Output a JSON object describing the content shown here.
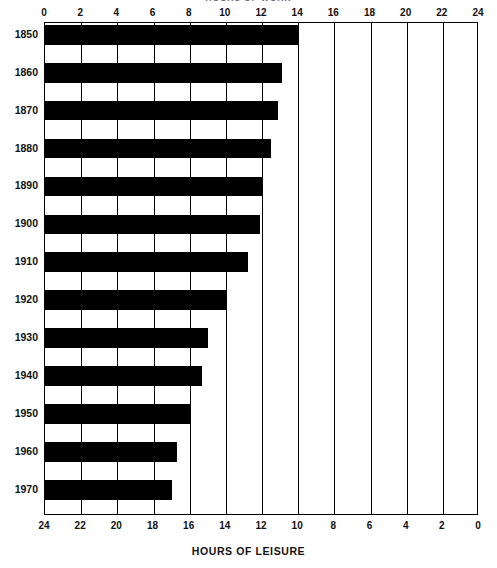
{
  "chart_data": {
    "type": "bar",
    "orientation": "horizontal",
    "title": "HOURS OF WORK",
    "bottom_caption": "HOURS OF LEISURE",
    "categories": [
      "1850",
      "1860",
      "1870",
      "1880",
      "1890",
      "1900",
      "1910",
      "1920",
      "1930",
      "1940",
      "1950",
      "1960",
      "1970"
    ],
    "values": [
      14.0,
      13.1,
      12.9,
      12.5,
      12.0,
      11.9,
      11.2,
      10.0,
      9.0,
      8.7,
      8.0,
      7.3,
      7.0
    ],
    "series": [
      {
        "name": "HOURS OF WORK",
        "values": [
          14.0,
          13.1,
          12.9,
          12.5,
          12.0,
          11.9,
          11.2,
          10.0,
          9.0,
          8.7,
          8.0,
          7.3,
          7.0
        ]
      },
      {
        "name": "HOURS OF LEISURE",
        "values": [
          10.0,
          10.9,
          11.1,
          11.5,
          12.0,
          12.1,
          12.8,
          14.0,
          15.0,
          15.3,
          16.0,
          16.7,
          17.0
        ]
      }
    ],
    "xlabel": "HOURS OF WORK",
    "ylabel": "",
    "xlim": [
      0,
      24
    ],
    "top_axis_ticks": [
      "0",
      "2",
      "4",
      "6",
      "8",
      "10",
      "12",
      "14",
      "16",
      "18",
      "20",
      "22",
      "24"
    ],
    "bottom_axis_ticks": [
      "24",
      "22",
      "20",
      "18",
      "16",
      "14",
      "12",
      "10",
      "8",
      "6",
      "4",
      "2",
      "0"
    ],
    "top_axis_direction": "left-to-right ascending",
    "bottom_axis_direction": "left-to-right descending",
    "grid": true,
    "gridline_interval": 2,
    "legend": "none",
    "bar_color": "#000000",
    "background_color": "#ffffff"
  },
  "axes": {
    "top": {
      "label": "HOURS OF WORK",
      "ticks": [
        "0",
        "2",
        "4",
        "6",
        "8",
        "10",
        "12",
        "14",
        "16",
        "18",
        "20",
        "22",
        "24"
      ]
    },
    "bottom": {
      "label": "HOURS OF LEISURE",
      "ticks": [
        "24",
        "22",
        "20",
        "18",
        "16",
        "14",
        "12",
        "10",
        "8",
        "6",
        "4",
        "2",
        "0"
      ]
    }
  }
}
